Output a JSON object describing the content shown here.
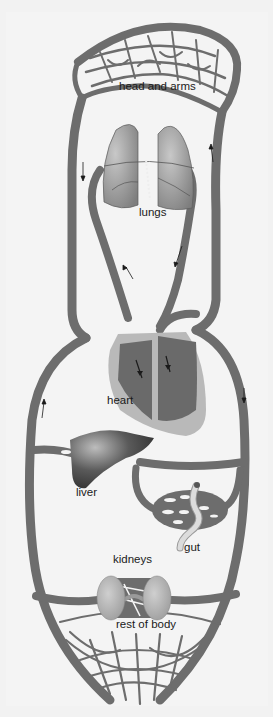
{
  "colors": {
    "background": "#f2f2f2",
    "vessel": "#6d6d6d",
    "vessel_dark": "#555555",
    "lungs": "#9a9a9a",
    "heart_outer": "#b9b9b9",
    "heart_chamber": "#6a6a6a",
    "liver": "#4a4a4a",
    "kidney": "#b4b4b4",
    "gut": "#d4d4d4"
  },
  "labels": {
    "head_and_arms": "head and arms",
    "lungs": "lungs",
    "heart": "heart",
    "liver": "liver",
    "gut": "gut",
    "kidneys": "kidneys",
    "rest_of_body": "rest of body"
  },
  "organs": [
    "head and arms",
    "lungs",
    "heart",
    "liver",
    "gut",
    "kidneys",
    "rest of body"
  ]
}
